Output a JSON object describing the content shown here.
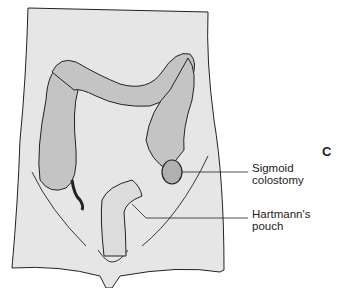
{
  "figure": {
    "panel_letter": "C",
    "labels": [
      {
        "id": "sigmoid-colostomy",
        "lines": [
          "Sigmoid",
          "colostomy"
        ]
      },
      {
        "id": "hartmanns-pouch",
        "lines": [
          "Hartmann's",
          "pouch"
        ]
      }
    ],
    "colors": {
      "body": "#e6e6e6",
      "colon": "#c4c4c4",
      "outline": "#222222"
    }
  }
}
